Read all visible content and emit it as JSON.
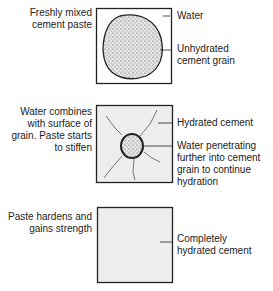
{
  "stages": [
    {
      "left_label": [
        "Freshly mixed",
        "cement paste"
      ],
      "annotations": [
        {
          "text": [
            "Water"
          ]
        },
        {
          "text": [
            "Unhydrated",
            "cement grain"
          ]
        }
      ]
    },
    {
      "left_label": [
        "Water combines",
        "with surface of",
        "grain. Paste starts",
        "to stiffen"
      ],
      "annotations": [
        {
          "text": [
            "Hydrated cement"
          ]
        },
        {
          "text": [
            "Water penetrating",
            "further into cement",
            "grain to continue",
            "hydration"
          ]
        }
      ]
    },
    {
      "left_label": [
        "Paste hardens and",
        "gains strength"
      ],
      "annotations": [
        {
          "text": [
            "Completely",
            "hydrated cement"
          ]
        }
      ]
    }
  ],
  "colors": {
    "line": "#222222",
    "fill_light": "#ededed",
    "grain": "#d8d8d8"
  }
}
